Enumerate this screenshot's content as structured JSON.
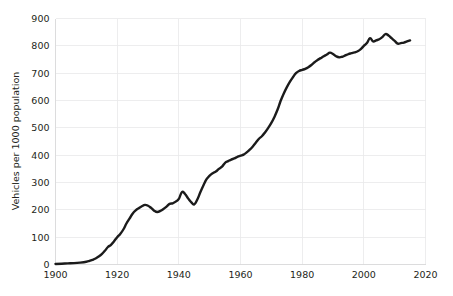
{
  "chart_data": {
    "type": "line",
    "title": "",
    "subtitle": "",
    "xlabel": "",
    "ylabel": "Vehicles per 1000 population",
    "xlim": [
      1900,
      2020
    ],
    "ylim": [
      0,
      900
    ],
    "grid": true,
    "legend": false,
    "legend_position": "none",
    "line_color": "#1b1b1b",
    "grid_color": "#e9e9ea",
    "background_color": "#ffffff",
    "xticks": [
      1900,
      1920,
      1940,
      1960,
      1980,
      2000,
      2020
    ],
    "xtick_labels": [
      "1900",
      "1920",
      "1940",
      "1960",
      "1980",
      "2000",
      "2020"
    ],
    "yticks": [
      0,
      100,
      200,
      300,
      400,
      500,
      600,
      700,
      800,
      900
    ],
    "ytick_labels": [
      "0",
      "100",
      "200",
      "300",
      "400",
      "500",
      "600",
      "700",
      "800",
      "900"
    ],
    "series": [
      {
        "name": "Vehicles per 1000 population",
        "x": [
          1900,
          1902,
          1904,
          1906,
          1908,
          1910,
          1911,
          1912,
          1913,
          1914,
          1915,
          1916,
          1917,
          1918,
          1919,
          1920,
          1921,
          1922,
          1923,
          1924,
          1925,
          1926,
          1927,
          1928,
          1929,
          1930,
          1931,
          1932,
          1933,
          1934,
          1935,
          1936,
          1937,
          1938,
          1939,
          1940,
          1941,
          1942,
          1943,
          1944,
          1945,
          1946,
          1947,
          1948,
          1949,
          1950,
          1951,
          1952,
          1953,
          1954,
          1955,
          1956,
          1957,
          1958,
          1959,
          1960,
          1961,
          1962,
          1963,
          1964,
          1965,
          1966,
          1967,
          1968,
          1969,
          1970,
          1971,
          1972,
          1973,
          1974,
          1975,
          1976,
          1977,
          1978,
          1979,
          1980,
          1981,
          1982,
          1983,
          1984,
          1985,
          1986,
          1987,
          1988,
          1989,
          1990,
          1991,
          1992,
          1993,
          1994,
          1995,
          1996,
          1997,
          1998,
          1999,
          2000,
          2001,
          2002,
          2003,
          2004,
          2005,
          2006,
          2007,
          2008,
          2009,
          2010,
          2011,
          2012,
          2013,
          2014,
          2015
        ],
        "y": [
          2,
          3,
          4,
          5,
          7,
          10,
          13,
          17,
          22,
          29,
          38,
          50,
          64,
          72,
          85,
          100,
          112,
          128,
          150,
          168,
          186,
          198,
          206,
          213,
          218,
          215,
          207,
          197,
          192,
          196,
          203,
          212,
          222,
          224,
          230,
          240,
          265,
          258,
          242,
          228,
          220,
          238,
          265,
          290,
          312,
          325,
          334,
          340,
          350,
          358,
          372,
          378,
          384,
          388,
          394,
          398,
          402,
          410,
          420,
          432,
          446,
          460,
          470,
          484,
          500,
          518,
          540,
          566,
          598,
          625,
          648,
          668,
          685,
          700,
          708,
          712,
          716,
          722,
          730,
          740,
          748,
          755,
          762,
          768,
          775,
          770,
          762,
          758,
          760,
          765,
          770,
          773,
          776,
          780,
          788,
          800,
          810,
          828,
          816,
          820,
          824,
          832,
          843,
          838,
          828,
          818,
          808,
          810,
          812,
          816,
          820
        ]
      }
    ]
  }
}
